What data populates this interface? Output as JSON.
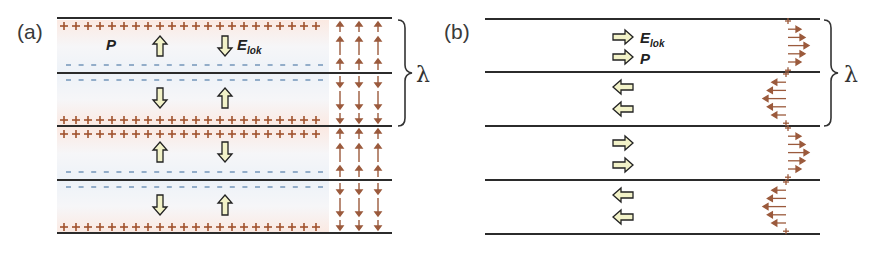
{
  "colors": {
    "layer_line": "#2b2b2b",
    "positive_charge": "#a0522d",
    "negative_charge": "#6a8fb5",
    "field_arrow": "#9b5a3c",
    "block_arrow_fill": "#f2f2c8",
    "block_arrow_stroke": "#222222",
    "pink_band": "#fbeee8",
    "blue_band": "#eef3f8"
  },
  "panel_a": {
    "label": "(a)",
    "polarization_symbol": "P",
    "field_symbol": "E",
    "field_subscript": "lok",
    "wavelength_symbol": "λ",
    "charge_plus": "+",
    "charge_minus": "-",
    "layers": [
      {
        "P": "up",
        "E_lok": "down"
      },
      {
        "P": "down",
        "E_lok": "up"
      },
      {
        "P": "up",
        "E_lok": "down"
      },
      {
        "P": "down",
        "E_lok": "up"
      }
    ]
  },
  "panel_b": {
    "label": "(b)",
    "polarization_symbol": "P",
    "field_symbol": "E",
    "field_subscript": "lok",
    "wavelength_symbol": "λ",
    "layers": [
      {
        "E_lok": "right",
        "P": "right"
      },
      {
        "E_lok": "left",
        "P": "left"
      },
      {
        "E_lok": "right",
        "P": "right"
      },
      {
        "E_lok": "left",
        "P": "left"
      }
    ]
  }
}
